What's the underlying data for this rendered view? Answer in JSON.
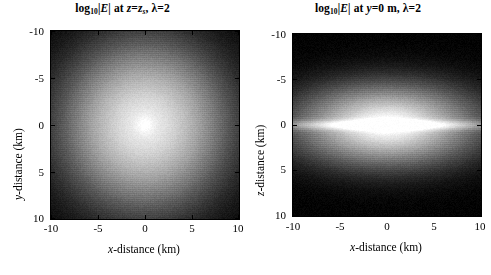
{
  "figure": {
    "background_color": "#ffffff",
    "text_color": "#000000",
    "panel_count": 2
  },
  "chart_data": [
    {
      "type": "heatmap",
      "panel": "left",
      "title": "log10|E| at z=z_s, lambda=2",
      "title_parts": {
        "log_base": "10",
        "quantity": "|E|",
        "connector": "at",
        "slice_var": "z",
        "slice_value": "z",
        "slice_subscript": "s",
        "lambda_symbol": "λ",
        "lambda_value": "2"
      },
      "xlabel": "x-distance (km)",
      "ylabel": "y-distance (km)",
      "xlim": [
        -10,
        10
      ],
      "ylim": [
        -10,
        10
      ],
      "y_axis_inverted": true,
      "xticks": [
        -10,
        -5,
        0,
        5,
        10
      ],
      "yticks": [
        -10,
        -5,
        0,
        5,
        10
      ],
      "xticklabels": [
        "-10",
        "-5",
        "0",
        "5",
        "10"
      ],
      "yticklabels": [
        "-10",
        "-5",
        "0",
        "5",
        "10"
      ],
      "colormap": "gray",
      "grid": false,
      "pattern": "radially-symmetric bright core at origin decaying to black at edges",
      "peak_location": [
        0,
        0
      ],
      "peak_value_normalized": 1.0,
      "edge_value_normalized": 0.0,
      "profile_samples": [
        {
          "radius_km": 0.0,
          "normalized_intensity": 1.0
        },
        {
          "radius_km": 2.0,
          "normalized_intensity": 0.92
        },
        {
          "radius_km": 4.0,
          "normalized_intensity": 0.8
        },
        {
          "radius_km": 6.0,
          "normalized_intensity": 0.6
        },
        {
          "radius_km": 8.0,
          "normalized_intensity": 0.33
        },
        {
          "radius_km": 10.0,
          "normalized_intensity": 0.1
        },
        {
          "radius_km": 12.0,
          "normalized_intensity": 0.02
        }
      ]
    },
    {
      "type": "heatmap",
      "panel": "right",
      "title": "log10|E| at y=0 m, lambda=2",
      "title_parts": {
        "log_base": "10",
        "quantity": "|E|",
        "connector": "at",
        "slice_var": "y",
        "slice_value": "0",
        "slice_unit": "m",
        "lambda_symbol": "λ",
        "lambda_value": "2"
      },
      "xlabel": "x-distance (km)",
      "ylabel": "z-distance (km)",
      "xlim": [
        -10,
        10
      ],
      "ylim": [
        -10,
        10
      ],
      "y_axis_inverted": true,
      "xticks": [
        -10,
        -5,
        0,
        5,
        10
      ],
      "yticks": [
        -10,
        -5,
        0,
        5,
        10
      ],
      "xticklabels": [
        "-10",
        "-5",
        "0",
        "5",
        "10"
      ],
      "yticklabels": [
        "-10",
        "-5",
        "0",
        "5",
        "10"
      ],
      "colormap": "gray",
      "grid": false,
      "pattern": "horizontally elongated elliptical bright lobe centred at origin with a thin bright horizontal streak reaching both x edges",
      "peak_location": [
        0,
        0
      ],
      "peak_value_normalized": 1.0,
      "edge_value_normalized": 0.0,
      "ellipse_semi_axes_km": {
        "x": 11.0,
        "z": 5.0
      },
      "profile_samples_x": [
        {
          "x_km": 0.0,
          "normalized_intensity": 1.0
        },
        {
          "x_km": 3.0,
          "normalized_intensity": 0.93
        },
        {
          "x_km": 6.0,
          "normalized_intensity": 0.78
        },
        {
          "x_km": 9.0,
          "normalized_intensity": 0.52
        },
        {
          "x_km": 10.0,
          "normalized_intensity": 0.42
        }
      ],
      "profile_samples_z": [
        {
          "z_km": 0.0,
          "normalized_intensity": 1.0
        },
        {
          "z_km": 2.0,
          "normalized_intensity": 0.78
        },
        {
          "z_km": 4.0,
          "normalized_intensity": 0.42
        },
        {
          "z_km": 6.0,
          "normalized_intensity": 0.12
        },
        {
          "z_km": 8.0,
          "normalized_intensity": 0.02
        },
        {
          "z_km": 10.0,
          "normalized_intensity": 0.0
        }
      ]
    }
  ],
  "panels": {
    "left": {
      "title_text": "log",
      "title_sub": "10",
      "title_abs": "|E|",
      "title_at": " at ",
      "title_slice_var": "z",
      "title_eq": "=",
      "title_slice_val": "z",
      "title_slice_sub": "s",
      "title_comma": ", ",
      "title_lambda": "λ",
      "title_lambda_eq": "=2",
      "xlabel_it": "x",
      "xlabel_rest": "-distance (km)",
      "ylabel_it": "y",
      "ylabel_rest": "-distance (km)",
      "xticklabels": [
        "-10",
        "-5",
        "0",
        "5",
        "10"
      ],
      "yticklabels": [
        "-10",
        "-5",
        "0",
        "5",
        "10"
      ]
    },
    "right": {
      "title_text": "log",
      "title_sub": "10",
      "title_abs": "|E|",
      "title_at": " at ",
      "title_slice_var": "y",
      "title_eq": "=0 m",
      "title_comma": ", ",
      "title_lambda": "λ",
      "title_lambda_eq": "=2",
      "xlabel_it": "x",
      "xlabel_rest": "-distance (km)",
      "ylabel_it": "z",
      "ylabel_rest": "-distance (km)",
      "xticklabels": [
        "-10",
        "-5",
        "0",
        "5",
        "10"
      ],
      "yticklabels": [
        "-10",
        "-5",
        "0",
        "5",
        "10"
      ]
    }
  }
}
